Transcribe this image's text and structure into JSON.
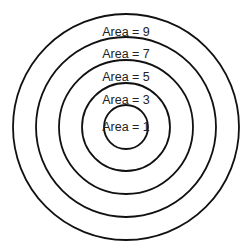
{
  "diagram": {
    "type": "concentric-circles",
    "center": [
      126,
      127
    ],
    "rings": [
      {
        "label": "Area = 9",
        "radius": 113,
        "label_y": 33
      },
      {
        "label": "Area = 7",
        "radius": 90,
        "label_y": 55
      },
      {
        "label": "Area = 5",
        "radius": 67,
        "label_y": 77
      },
      {
        "label": "Area = 3",
        "radius": 44,
        "label_y": 100
      },
      {
        "label": "Area = 1",
        "radius": 22,
        "label_y": 131
      }
    ],
    "stroke_color": "#111111",
    "background": "#ffffff"
  }
}
